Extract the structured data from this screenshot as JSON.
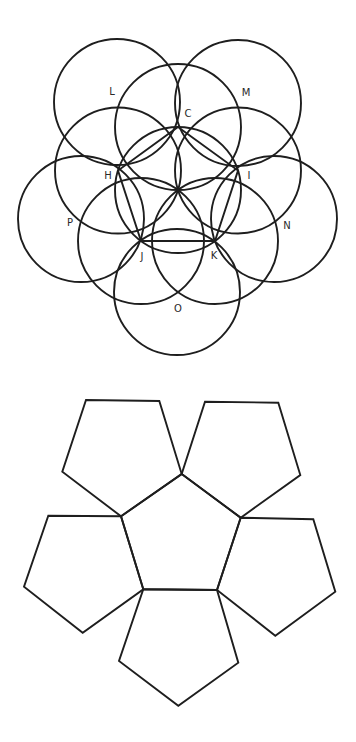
{
  "figure": {
    "stroke_color": "#1e1e1e",
    "background": "#ffffff"
  },
  "circle_construction": {
    "center": {
      "x": 178,
      "y": 190
    },
    "radius": 63,
    "inner_points": {
      "C": {
        "x": 178,
        "y": 127
      },
      "I": {
        "x": 238,
        "y": 170.5
      },
      "K": {
        "x": 215,
        "y": 241
      },
      "J": {
        "x": 141,
        "y": 241
      },
      "H": {
        "x": 118,
        "y": 170.5
      }
    },
    "outer_centers": {
      "L": {
        "x": 117,
        "y": 102
      },
      "M": {
        "x": 238,
        "y": 103
      },
      "N": {
        "x": 274,
        "y": 219
      },
      "O": {
        "x": 177,
        "y": 292
      },
      "P": {
        "x": 81,
        "y": 219
      }
    },
    "labels": [
      {
        "id": "L",
        "text": "L",
        "x": 112,
        "y": 92
      },
      {
        "id": "M",
        "text": "M",
        "x": 246,
        "y": 93
      },
      {
        "id": "C",
        "text": "C",
        "x": 188,
        "y": 114
      },
      {
        "id": "H",
        "text": "H",
        "x": 108,
        "y": 176
      },
      {
        "id": "I",
        "text": "I",
        "x": 249,
        "y": 176
      },
      {
        "id": "P",
        "text": "P",
        "x": 70,
        "y": 223
      },
      {
        "id": "N",
        "text": "N",
        "x": 287,
        "y": 226
      },
      {
        "id": "J",
        "text": "J",
        "x": 142,
        "y": 257
      },
      {
        "id": "K",
        "text": "K",
        "x": 214,
        "y": 256
      },
      {
        "id": "O",
        "text": "O",
        "x": 178,
        "y": 309
      }
    ]
  },
  "pentagon_net": {
    "center_face": "181.7,474 240.7,517.7 217,590 143.3,589.3 121,516.3",
    "faces": [
      {
        "id": "top-left",
        "points": "86,400 159.3,401 181.7,474 121,516.3 62.3,471.7"
      },
      {
        "id": "top-right",
        "points": "205,401.7 278.3,402.7 300.3,475 240.7,517.7 181.7,474"
      },
      {
        "id": "right",
        "points": "240.7,517.7 313.3,519.3 335.3,591.7 275.3,635.7 217,590"
      },
      {
        "id": "bottom",
        "points": "143.3,589.3 217,590 238.3,662.7 178.3,705.7 119,661"
      },
      {
        "id": "left",
        "points": "48.3,515.7 121,516.3 143.3,589.3 82.7,632.7 24,586.7"
      }
    ]
  }
}
